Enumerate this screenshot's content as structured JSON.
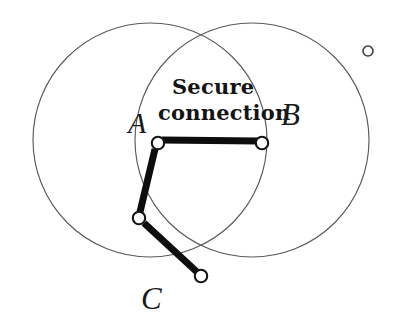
{
  "figure": {
    "background_color": "#ffffff",
    "width": 396,
    "height": 332,
    "caption": {
      "line_1": "Secure",
      "line_2": "connection"
    },
    "labels": {
      "a": "A",
      "b": "B",
      "c": "C"
    },
    "colors": {
      "circle_stroke": "#5a5a5f",
      "link_stroke": "#0d0d0d",
      "node_fill": "#ffffff",
      "node_stroke": "#151515",
      "text": "#141414"
    },
    "venn_circles": [
      {
        "name": "left-coverage-circle",
        "cx": 150,
        "cy": 140,
        "r": 117
      },
      {
        "name": "right-coverage-circle",
        "cx": 252,
        "cy": 140,
        "r": 117
      }
    ],
    "nodes": [
      {
        "id": "node-a",
        "label": "A",
        "x": 158,
        "y": 143,
        "r": 6.2
      },
      {
        "id": "node-b",
        "label": "B",
        "x": 262,
        "y": 143,
        "r": 6.2
      },
      {
        "id": "node-relay",
        "label": "",
        "x": 139,
        "y": 218,
        "r": 6.2
      },
      {
        "id": "node-c",
        "label": "C",
        "x": 201,
        "y": 276,
        "r": 6.2
      },
      {
        "id": "node-isolated",
        "label": "",
        "x": 368,
        "y": 51,
        "r": 5.0
      }
    ],
    "links": [
      {
        "id": "link-a-b",
        "from": "node-a",
        "to": "node-b",
        "x1": 162,
        "y1": 140,
        "x2": 258,
        "y2": 141,
        "width": 7
      },
      {
        "id": "link-a-relay",
        "from": "node-a",
        "to": "node-relay",
        "x1": 155,
        "y1": 149,
        "x2": 140,
        "y2": 212,
        "width": 7
      },
      {
        "id": "link-relay-c",
        "from": "node-relay",
        "to": "node-c",
        "x1": 144,
        "y1": 223,
        "x2": 197,
        "y2": 272,
        "width": 7
      }
    ]
  }
}
